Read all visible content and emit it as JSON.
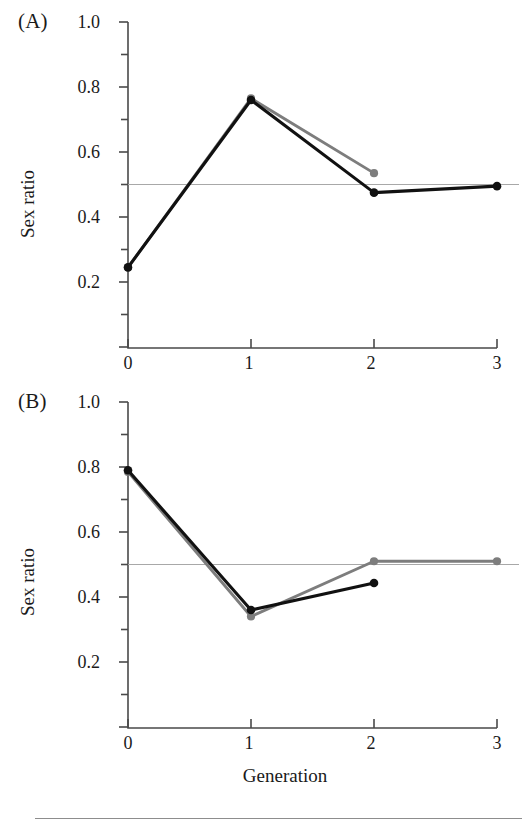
{
  "figure": {
    "panels": [
      {
        "label": "(A)",
        "ylabel": "Sex ratio",
        "xlabel": "",
        "yticks": [
          "1.0",
          "0.8",
          "0.6",
          "0.4",
          "0.2"
        ],
        "xticks": [
          "0",
          "1",
          "2",
          "3"
        ]
      },
      {
        "label": "(B)",
        "ylabel": "Sex ratio",
        "xlabel": "Generation",
        "yticks": [
          "1.0",
          "0.8",
          "0.6",
          "0.4",
          "0.2"
        ],
        "xticks": [
          "0",
          "1",
          "2",
          "3"
        ]
      }
    ]
  },
  "colors": {
    "series_black": "#111111",
    "series_gray": "#7d7d7d",
    "reference_line": "#a8a8a8",
    "axis": "#4a4a4a",
    "text": "#1a1a1a",
    "footer_rule": "#8d8d8d"
  },
  "chart_data": [
    {
      "type": "line",
      "panel": "(A)",
      "title": "",
      "xlabel": "",
      "ylabel": "Sex ratio",
      "x": [
        0,
        1,
        2,
        3
      ],
      "xlim": [
        0,
        3
      ],
      "ylim": [
        0,
        1.0
      ],
      "yticks": [
        0.2,
        0.4,
        0.6,
        0.8,
        1.0
      ],
      "xticks": [
        0,
        1,
        2,
        3
      ],
      "grid": false,
      "legend": "none",
      "reference_line_y": 0.5,
      "series": [
        {
          "name": "black",
          "color": "#111111",
          "x": [
            0,
            1,
            2,
            3
          ],
          "values": [
            0.245,
            0.76,
            0.475,
            0.495
          ],
          "markers": true
        },
        {
          "name": "gray",
          "color": "#7d7d7d",
          "x": [
            0,
            1,
            2
          ],
          "values": [
            0.245,
            0.765,
            0.535
          ],
          "markers": true
        }
      ]
    },
    {
      "type": "line",
      "panel": "(B)",
      "title": "",
      "xlabel": "Generation",
      "ylabel": "Sex ratio",
      "x": [
        0,
        1,
        2,
        3
      ],
      "xlim": [
        0,
        3
      ],
      "ylim": [
        0,
        1.0
      ],
      "yticks": [
        0.2,
        0.4,
        0.6,
        0.8,
        1.0
      ],
      "xticks": [
        0,
        1,
        2,
        3
      ],
      "grid": false,
      "legend": "none",
      "reference_line_y": 0.5,
      "series": [
        {
          "name": "black",
          "color": "#111111",
          "x": [
            0,
            1,
            2
          ],
          "values": [
            0.79,
            0.36,
            0.443
          ],
          "markers": true
        },
        {
          "name": "gray",
          "color": "#7d7d7d",
          "x": [
            0,
            1,
            2,
            3
          ],
          "values": [
            0.785,
            0.34,
            0.51,
            0.51
          ],
          "markers": true
        }
      ]
    }
  ]
}
